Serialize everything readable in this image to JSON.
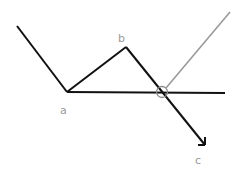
{
  "diagram": {
    "colors": {
      "main_line": "#111111",
      "secondary_line": "#9a9a9a",
      "label": "#9a9a9a",
      "marker": "#8a8a8a",
      "background": "#ffffff"
    },
    "points": {
      "a": {
        "label": "a"
      },
      "b": {
        "label": "b"
      },
      "c": {
        "label": "c"
      }
    },
    "elements": [
      {
        "type": "line",
        "name": "incoming-segment",
        "note": "from upper-left down to point a"
      },
      {
        "type": "line",
        "name": "segment-a-b",
        "note": "from a up to b"
      },
      {
        "type": "arrow",
        "name": "arrow-b-c",
        "note": "from b down through intersection to c"
      },
      {
        "type": "line",
        "name": "horizontal-baseline",
        "note": "horizontal line from a to the right"
      },
      {
        "type": "line",
        "name": "gray-reflected-line",
        "note": "gray line rising to upper-right from intersection"
      },
      {
        "type": "circle",
        "name": "intersection-marker",
        "note": "circle marking intersection of baseline and b-c line"
      }
    ]
  }
}
